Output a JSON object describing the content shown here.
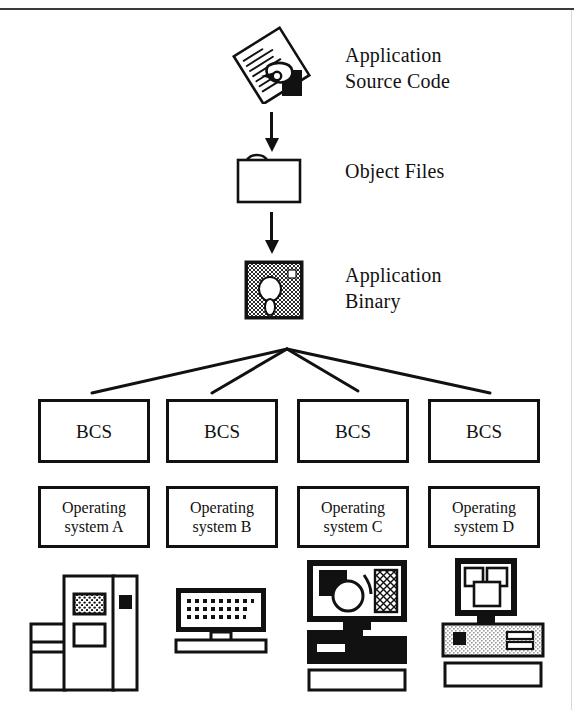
{
  "diagram": {
    "flow": [
      {
        "id": "source-code",
        "icon": "hand-writing-document-icon",
        "label": "Application\nSource Code"
      },
      {
        "id": "object-files",
        "icon": "folder-icon",
        "label": "Object Files"
      },
      {
        "id": "application-binary",
        "icon": "floppy-disk-icon",
        "label": "Application\nBinary"
      }
    ],
    "arrows": [
      {
        "id": "arrow-source-to-object",
        "from": "source-code",
        "to": "object-files"
      },
      {
        "id": "arrow-object-to-binary",
        "from": "object-files",
        "to": "application-binary"
      }
    ],
    "fanout": {
      "id": "binary-fanout",
      "origin_label": "application-binary",
      "branch_count": 4
    },
    "columns": [
      {
        "bcs_label": "BCS",
        "os_label": "Operating\nsystem A",
        "machine_icon": "mainframe-computer-icon"
      },
      {
        "bcs_label": "BCS",
        "os_label": "Operating\nsystem B",
        "machine_icon": "desktop-terminal-icon"
      },
      {
        "bcs_label": "BCS",
        "os_label": "Operating\nsystem C",
        "machine_icon": "graphics-workstation-icon"
      },
      {
        "bcs_label": "BCS",
        "os_label": "Operating\nsystem D",
        "machine_icon": "personal-computer-icon"
      }
    ],
    "colors": {
      "ink": "#111111",
      "paper": "#ffffff",
      "dither_dark": "#404040",
      "dither_light": "#c9c9c9"
    }
  }
}
